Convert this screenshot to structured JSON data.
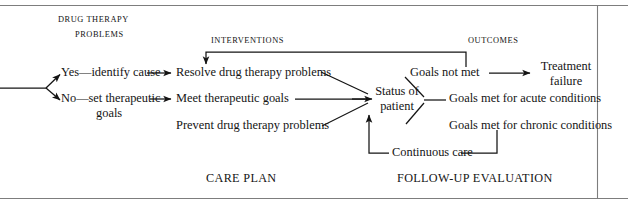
{
  "diagram": {
    "frame": {
      "border_color": "#7d7d7d",
      "background": "#ffffff"
    },
    "line_color": "#141414",
    "headers": [
      {
        "id": "drug-therapy-problems",
        "line1": "DRUG THERAPY",
        "line2": "PROBLEMS"
      },
      {
        "id": "interventions",
        "line1": "INTERVENTIONS",
        "line2": ""
      },
      {
        "id": "outcomes",
        "line1": "OUTCOMES",
        "line2": ""
      }
    ],
    "nodes": {
      "yes_identify_cause": "Yes—identify cause",
      "no_set_therapeutic_l1": "No—set therapeutic",
      "no_set_therapeutic_l2": "goals",
      "resolve_problems": "Resolve drug therapy problems",
      "meet_goals": "Meet therapeutic goals",
      "prevent_problems": "Prevent drug therapy problems",
      "status_of_patient_l1": "Status of",
      "status_of_patient_l2": "patient",
      "goals_not_met": "Goals not met",
      "goals_met_acute": "Goals met for acute conditions",
      "goals_met_chronic": "Goals met for chronic conditions",
      "continuous_care": "Continuous care",
      "treatment_failure_l1": "Treatment",
      "treatment_failure_l2": "failure"
    },
    "captions": {
      "care_plan": "CARE PLAN",
      "follow_up_evaluation": "FOLLOW-UP EVALUATION"
    }
  }
}
